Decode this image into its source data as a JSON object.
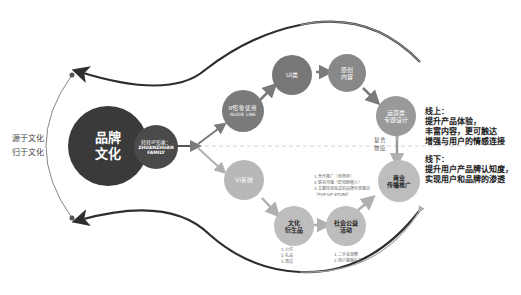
{
  "left_labels": {
    "line1": "源于文化",
    "line2": "归于文化"
  },
  "nodes": {
    "brand_culture": {
      "line1": "品牌",
      "line2": "文化"
    },
    "ip_image": {
      "line1": "转转IP形象：",
      "line2": "ZHUANZHUAN",
      "line3": "FAMILY"
    },
    "ip_guideline": {
      "line1": "IP形象使用",
      "line2": "GUIDE LINE"
    },
    "ui": {
      "line1": "UI类"
    },
    "original_content": {
      "line1": "原创",
      "line2": "内容"
    },
    "ops_design": {
      "line1": "运营类",
      "line2": "专题设计"
    },
    "vi_system": {
      "line1": "VI系统"
    },
    "derivatives": {
      "line1": "文化",
      "line2": "衍生品"
    },
    "public_welfare": {
      "line1": "社会公益",
      "line2": "活动"
    },
    "commercial": {
      "line1": "商业",
      "line2": "传播推广"
    }
  },
  "lists": {
    "derivatives": [
      "1.公仔",
      "2.礼品",
      "3.周边"
    ],
    "public_welfare": [
      "1.二手衣捐赠",
      "2.用户感谢礼品"
    ],
    "commercial": [
      "1.合作推广（世界杯）",
      "2.联名传播（影视剧植入）",
      "3.主题性体验式的品牌外部输出",
      "（POP-UP STORE）"
    ]
  },
  "composite_effect": {
    "line1": "复合",
    "line2": "效应"
  },
  "notes": {
    "online": {
      "title": "线上：",
      "lines": [
        "提升产品体验，",
        "丰富内容，更可触达",
        "增强与用户的情感连接"
      ]
    },
    "offline": {
      "title": "线下：",
      "lines": [
        "提升用户产品牌认知度，",
        "实现用户和品牌的渗透"
      ]
    }
  },
  "colors": {
    "dark": "#3a3a3a",
    "mid": "#8a8a8a",
    "light": "#bdbdbd",
    "arrow": "#7a7a7a"
  }
}
